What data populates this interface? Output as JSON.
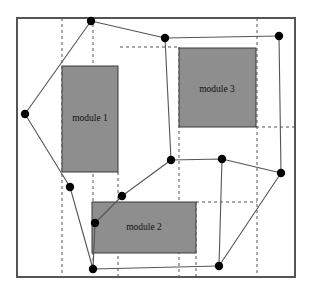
{
  "figure": {
    "canvas": {
      "width": 311,
      "height": 295
    },
    "colors": {
      "background": "#ffffff",
      "frame_stroke": "#555555",
      "module_fill": "#8e8e8e",
      "module_stroke": "#3a3a3a",
      "polygon_stroke": "#555555",
      "vertex_fill": "#000000",
      "grid_stroke": "#555555",
      "label_color": "#111111"
    },
    "frame": {
      "x": 17,
      "y": 18,
      "width": 278,
      "height": 259,
      "stroke_width": 2
    }
  },
  "modules": [
    {
      "id": "module-1",
      "label": "module 1",
      "x": 62,
      "y": 66,
      "width": 56,
      "height": 106,
      "label_x": 90,
      "label_y": 119
    },
    {
      "id": "module-2",
      "label": "module 2",
      "x": 92,
      "y": 202,
      "width": 104,
      "height": 51,
      "label_x": 144,
      "label_y": 228
    },
    {
      "id": "module-3",
      "label": "module 3",
      "x": 179,
      "y": 48,
      "width": 77,
      "height": 79,
      "label_x": 217,
      "label_y": 90
    }
  ],
  "grid": {
    "description": "dashed slicing lines",
    "vertical_lines": [
      {
        "id": "v1",
        "x": 62,
        "y1": 18,
        "y2": 277
      },
      {
        "id": "v2",
        "x": 93,
        "y1": 18,
        "y2": 277
      },
      {
        "id": "v3",
        "x": 118,
        "y1": 172,
        "y2": 277
      },
      {
        "id": "v4",
        "x": 179,
        "y1": 47,
        "y2": 277
      },
      {
        "id": "v5",
        "x": 196,
        "y1": 202,
        "y2": 277
      },
      {
        "id": "v6",
        "x": 257,
        "y1": 18,
        "y2": 277
      }
    ],
    "horizontal_lines": [
      {
        "id": "h1",
        "y": 47,
        "x1": 120,
        "x2": 179
      },
      {
        "id": "h2",
        "y": 127,
        "x1": 256,
        "x2": 295
      },
      {
        "id": "h3",
        "y": 202,
        "x1": 196,
        "x2": 257
      }
    ]
  },
  "polygon": {
    "id": "bounding-polygon",
    "closed": true,
    "vertices": [
      {
        "index": 0,
        "x": 91,
        "y": 21
      },
      {
        "index": 1,
        "x": 165,
        "y": 38
      },
      {
        "index": 2,
        "x": 279,
        "y": 36
      },
      {
        "index": 3,
        "x": 281,
        "y": 173
      },
      {
        "index": 4,
        "x": 219,
        "y": 266
      },
      {
        "index": 5,
        "x": 93,
        "y": 269
      },
      {
        "index": 6,
        "x": 95,
        "y": 223
      },
      {
        "index": 7,
        "x": 70,
        "y": 187
      },
      {
        "index": 8,
        "x": 25,
        "y": 114
      }
    ]
  },
  "polygon_chains": [
    {
      "id": "chain-upper-left",
      "points": [
        [
          91,
          21
        ],
        [
          165,
          38
        ],
        [
          279,
          36
        ]
      ]
    },
    {
      "id": "chain-right",
      "points": [
        [
          279,
          36
        ],
        [
          281,
          173
        ],
        [
          219,
          266
        ]
      ]
    },
    {
      "id": "chain-bottom",
      "points": [
        [
          219,
          266
        ],
        [
          93,
          269
        ]
      ]
    },
    {
      "id": "chain-left-outer",
      "points": [
        [
          93,
          269
        ],
        [
          70,
          187
        ],
        [
          25,
          114
        ],
        [
          91,
          21
        ]
      ]
    },
    {
      "id": "chain-inner-lower",
      "points": [
        [
          93,
          269
        ],
        [
          95,
          223
        ],
        [
          122,
          196
        ],
        [
          171,
          160
        ],
        [
          222,
          159
        ],
        [
          281,
          173
        ]
      ]
    },
    {
      "id": "chain-inner-mid",
      "points": [
        [
          165,
          38
        ],
        [
          171,
          160
        ]
      ]
    },
    {
      "id": "chain-inner-right",
      "points": [
        [
          222,
          159
        ],
        [
          219,
          266
        ]
      ]
    }
  ],
  "vertex_markers": [
    {
      "id": "p0",
      "x": 91,
      "y": 21,
      "r": 4.2
    },
    {
      "id": "p1",
      "x": 165,
      "y": 38,
      "r": 4.2
    },
    {
      "id": "p2",
      "x": 279,
      "y": 36,
      "r": 4.2
    },
    {
      "id": "p3",
      "x": 281,
      "y": 173,
      "r": 4.2
    },
    {
      "id": "p4",
      "x": 219,
      "y": 266,
      "r": 4.2
    },
    {
      "id": "p5",
      "x": 93,
      "y": 269,
      "r": 4.2
    },
    {
      "id": "p6",
      "x": 95,
      "y": 223,
      "r": 4.2
    },
    {
      "id": "p7",
      "x": 70,
      "y": 187,
      "r": 4.2
    },
    {
      "id": "p8",
      "x": 25,
      "y": 114,
      "r": 4.2
    },
    {
      "id": "p9",
      "x": 171,
      "y": 160,
      "r": 4.2
    },
    {
      "id": "p10",
      "x": 222,
      "y": 159,
      "r": 4.2
    },
    {
      "id": "p11",
      "x": 122,
      "y": 196,
      "r": 4.2
    }
  ]
}
